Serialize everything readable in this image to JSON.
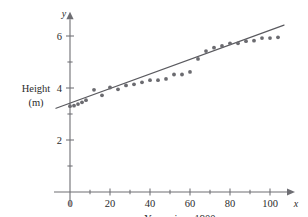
{
  "chart_data": {
    "type": "scatter",
    "title": "",
    "subtitle": "",
    "xlabel": "Years since 1900",
    "ylabel": "Height\n(m)",
    "ylabel_line1": "Height",
    "ylabel_line2": "(m)",
    "x_axis_name": "x",
    "y_axis_name": "y",
    "xlim": [
      -8,
      112
    ],
    "ylim": [
      0,
      6.8
    ],
    "xticks": [
      0,
      20,
      40,
      60,
      80,
      100
    ],
    "xtick_labels": [
      "0",
      "20",
      "40",
      "60",
      "80",
      "100"
    ],
    "x_minor_ticks": [
      10,
      30,
      50,
      70,
      90,
      110
    ],
    "yticks": [
      2,
      4,
      6
    ],
    "ytick_labels": [
      "2",
      "4",
      "6"
    ],
    "y_minor_ticks": [
      1,
      3,
      5
    ],
    "grid": false,
    "legend": null,
    "point_color": "#6b6b70",
    "line_color": "#5a5a5f",
    "axis_color": "#6e6e73",
    "series": [
      {
        "name": "Pole vault record height",
        "marker": "circle",
        "points": [
          [
            0,
            3.3
          ],
          [
            2,
            3.32
          ],
          [
            4,
            3.38
          ],
          [
            6,
            3.45
          ],
          [
            8,
            3.53
          ],
          [
            12,
            3.93
          ],
          [
            16,
            3.72
          ],
          [
            20,
            4.02
          ],
          [
            24,
            3.95
          ],
          [
            28,
            4.1
          ],
          [
            32,
            4.14
          ],
          [
            36,
            4.22
          ],
          [
            40,
            4.3
          ],
          [
            44,
            4.3
          ],
          [
            48,
            4.35
          ],
          [
            52,
            4.52
          ],
          [
            56,
            4.52
          ],
          [
            60,
            4.62
          ],
          [
            64,
            5.12
          ],
          [
            68,
            5.42
          ],
          [
            72,
            5.55
          ],
          [
            76,
            5.62
          ],
          [
            80,
            5.72
          ],
          [
            84,
            5.72
          ],
          [
            88,
            5.8
          ],
          [
            92,
            5.82
          ],
          [
            96,
            5.92
          ],
          [
            100,
            5.92
          ],
          [
            104,
            5.95
          ]
        ]
      }
    ],
    "fit_line": {
      "name": "least-squares regression line",
      "x_start": -7,
      "y_start": 3.22,
      "x_end": 107,
      "y_end": 6.42
    }
  }
}
